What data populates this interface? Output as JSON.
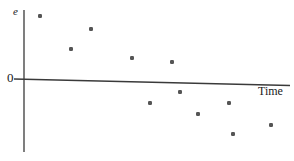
{
  "chart_data": {
    "type": "scatter",
    "title": "",
    "subtitle": "",
    "xlabel": "Time",
    "ylabel": "e",
    "origin_label": "0",
    "grid": false,
    "legend": null,
    "xlim": [
      0,
      12
    ],
    "ylim": [
      -5,
      5
    ],
    "axis_style": {
      "x_axis_sloped": true,
      "x_axis_note": "horizontal reference axis drawn with a slight downward slope",
      "marker_color": "#555555",
      "axis_color": "#3a3a3a",
      "marker_size_px": 4
    },
    "series": [
      {
        "name": "Residuals",
        "x": [
          1.0,
          2.4,
          3.4,
          5.2,
          7.0,
          5.9,
          7.4,
          8.5,
          10.0,
          10.2,
          12.1
        ],
        "y": [
          4.3,
          2.0,
          3.3,
          1.2,
          1.0,
          -1.5,
          -0.7,
          -2.2,
          -1.4,
          -3.2,
          -2.4
        ],
        "px": [
          {
            "x": 40,
            "y": 16
          },
          {
            "x": 71,
            "y": 49
          },
          {
            "x": 91,
            "y": 29
          },
          {
            "x": 132,
            "y": 58
          },
          {
            "x": 172,
            "y": 62
          },
          {
            "x": 150,
            "y": 103
          },
          {
            "x": 180,
            "y": 92
          },
          {
            "x": 198,
            "y": 114
          },
          {
            "x": 229,
            "y": 103
          },
          {
            "x": 233,
            "y": 134
          },
          {
            "x": 271,
            "y": 125
          }
        ]
      }
    ],
    "annotations": []
  }
}
